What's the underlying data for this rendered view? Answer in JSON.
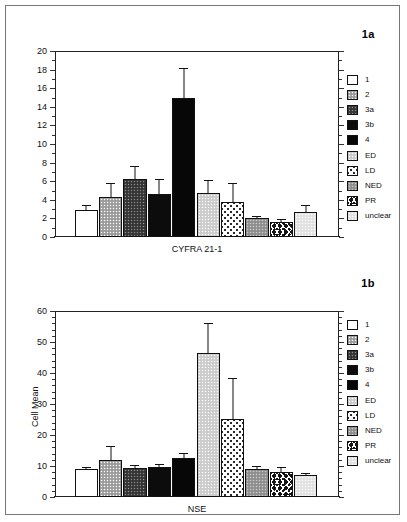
{
  "figures": [
    {
      "id": "1a",
      "label": "1a",
      "chart_data": {
        "type": "bar",
        "title": "1a",
        "xlabel": "CYFRA 21-1",
        "ylabel": "",
        "ylim": [
          0,
          20
        ],
        "yticks": [
          0,
          2,
          4,
          6,
          8,
          10,
          12,
          14,
          16,
          18,
          20
        ],
        "grid": false,
        "legend_position": "right",
        "categories": [
          "1",
          "2",
          "3a",
          "3b",
          "4",
          "ED",
          "LD",
          "NED",
          "PR",
          "unclear"
        ],
        "values": [
          2.9,
          4.3,
          6.2,
          4.6,
          15.0,
          4.75,
          3.8,
          2.0,
          1.6,
          2.65
        ],
        "errors": [
          0.4,
          1.4,
          1.35,
          1.5,
          3.1,
          1.25,
          1.9,
          0.2,
          0.25,
          0.7
        ]
      }
    },
    {
      "id": "1b",
      "label": "1b",
      "chart_data": {
        "type": "bar",
        "title": "1b",
        "xlabel": "NSE",
        "ylabel": "Cell Mean",
        "ylim": [
          0,
          60
        ],
        "yticks": [
          0,
          10,
          20,
          30,
          40,
          50,
          60
        ],
        "grid": false,
        "legend_position": "right",
        "categories": [
          "1",
          "2",
          "3a",
          "3b",
          "4",
          "ED",
          "LD",
          "NED",
          "PR",
          "unclear"
        ],
        "values": [
          8.9,
          11.8,
          9.5,
          9.8,
          12.6,
          46.6,
          25.3,
          9.0,
          8.2,
          7.0
        ],
        "errors": [
          0.6,
          4.4,
          0.4,
          0.6,
          1.2,
          9.3,
          12.8,
          0.7,
          1.2,
          0.4
        ]
      }
    }
  ],
  "legend": {
    "items": [
      {
        "label": "1",
        "fill": "f-white"
      },
      {
        "label": "2",
        "fill": "f-gray-stipple"
      },
      {
        "label": "3a",
        "fill": "f-dark-hatch"
      },
      {
        "label": "3b",
        "fill": "f-black"
      },
      {
        "label": "4",
        "fill": "f-black2"
      },
      {
        "label": "ED",
        "fill": "f-lightgray"
      },
      {
        "label": "LD",
        "fill": "f-speckle"
      },
      {
        "label": "NED",
        "fill": "f-medgray"
      },
      {
        "label": "PR",
        "fill": "f-bold-speckle"
      },
      {
        "label": "unclear",
        "fill": "f-verylight"
      }
    ]
  },
  "colors": {
    "axis": "#222222",
    "text": "#111111",
    "frame": "#777777",
    "background": "#ffffff"
  }
}
